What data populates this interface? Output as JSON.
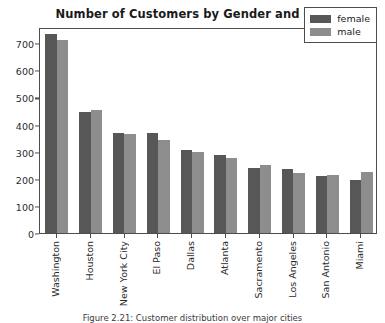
{
  "chart_data": {
    "type": "bar",
    "title": "Number of Customers by Gender and City",
    "xlabel": "",
    "ylabel": "",
    "ylim": [
      0,
      760
    ],
    "yticks": [
      0,
      100,
      200,
      300,
      400,
      500,
      600,
      700
    ],
    "grid": false,
    "legend_position": "upper right",
    "categories": [
      "Washington",
      "Houston",
      "New York City",
      "El Paso",
      "Dallas",
      "Atlanta",
      "Sacramento",
      "Los Angeles",
      "San Antonio",
      "Miami"
    ],
    "series": [
      {
        "name": "female",
        "color": "#575757",
        "values": [
          733,
          445,
          370,
          370,
          305,
          288,
          240,
          238,
          210,
          196
        ]
      },
      {
        "name": "male",
        "color": "#8d8d8d",
        "values": [
          712,
          455,
          365,
          345,
          300,
          277,
          250,
          222,
          215,
          226
        ]
      }
    ]
  },
  "caption": {
    "text": "Figure 2.21: Customer distribution over major cities"
  }
}
